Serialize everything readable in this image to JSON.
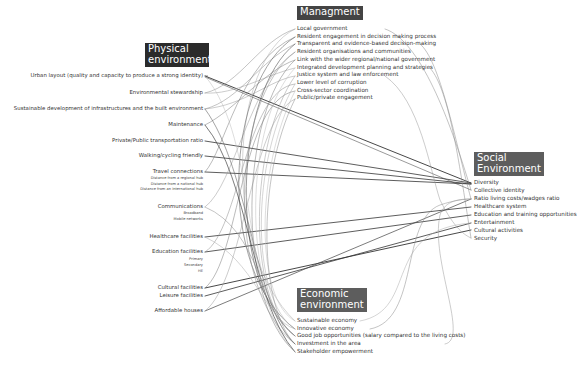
{
  "physical": {
    "title_line1": "Physical",
    "title_line2": "environment",
    "items": [
      {
        "label": "Urban layout (quality and capacity to produce a strong identity)",
        "y": 76
      },
      {
        "label": "Environmental stewardship",
        "y": 93
      },
      {
        "label": "Sustainable development of infrastructures and the built environment",
        "y": 109
      },
      {
        "label": "Maintenance",
        "y": 125
      },
      {
        "label": "Private/Public transportation ratio",
        "y": 141
      },
      {
        "label": "Walking/cycling friendly",
        "y": 156
      },
      {
        "label": "Travel connections",
        "y": 172
      },
      {
        "label": "Communications",
        "y": 207
      },
      {
        "label": "Healthcare facilities",
        "y": 237
      },
      {
        "label": "Education facilities",
        "y": 252
      },
      {
        "label": "Cultural facilities",
        "y": 288
      },
      {
        "label": "Leisure facilities",
        "y": 296
      },
      {
        "label": "Affordable houses",
        "y": 311
      }
    ],
    "travel_sub": [
      "Distance from a regional hub",
      "Distance from a national hub",
      "Distance from an international hub"
    ],
    "communications_sub": [
      "Broadband",
      "Mobile networks"
    ],
    "education_sub": [
      "Primary",
      "Secondary",
      "HE"
    ]
  },
  "management": {
    "title": "Managment",
    "items": [
      "Local government",
      "Resident engagement in decision making process",
      "Transparent and evidence-based decision-making",
      "Resident organisations and communities",
      "Link with the wider regional/national government",
      "Integrated development planning and strategies",
      "Justice system and law enforcement",
      "Lower level of corruption",
      "Cross-sector coordination",
      "Public/private engagement"
    ]
  },
  "social": {
    "title_line1": "Social",
    "title_line2": "Environment",
    "items": [
      "Diversity",
      "Collective identity",
      "Ratio living costs/wadges ratio",
      "Healthcare system",
      "Education and training opportunities",
      "Entertainment",
      "Cultural activities",
      "Security"
    ]
  },
  "economic": {
    "title_line1": "Economic",
    "title_line2": "environment",
    "items": [
      "Sustainable economy",
      "Innovative economy",
      "Good job opportunities (salary compared to the living costs)",
      "Investment in the area",
      "Stakeholder empowerment"
    ]
  },
  "colors": {
    "title_dark": "#2b2b2b",
    "title_grey": "#5d5d5d",
    "line_dark": "#3a3a3a",
    "line_light": "#9a9a9a"
  }
}
